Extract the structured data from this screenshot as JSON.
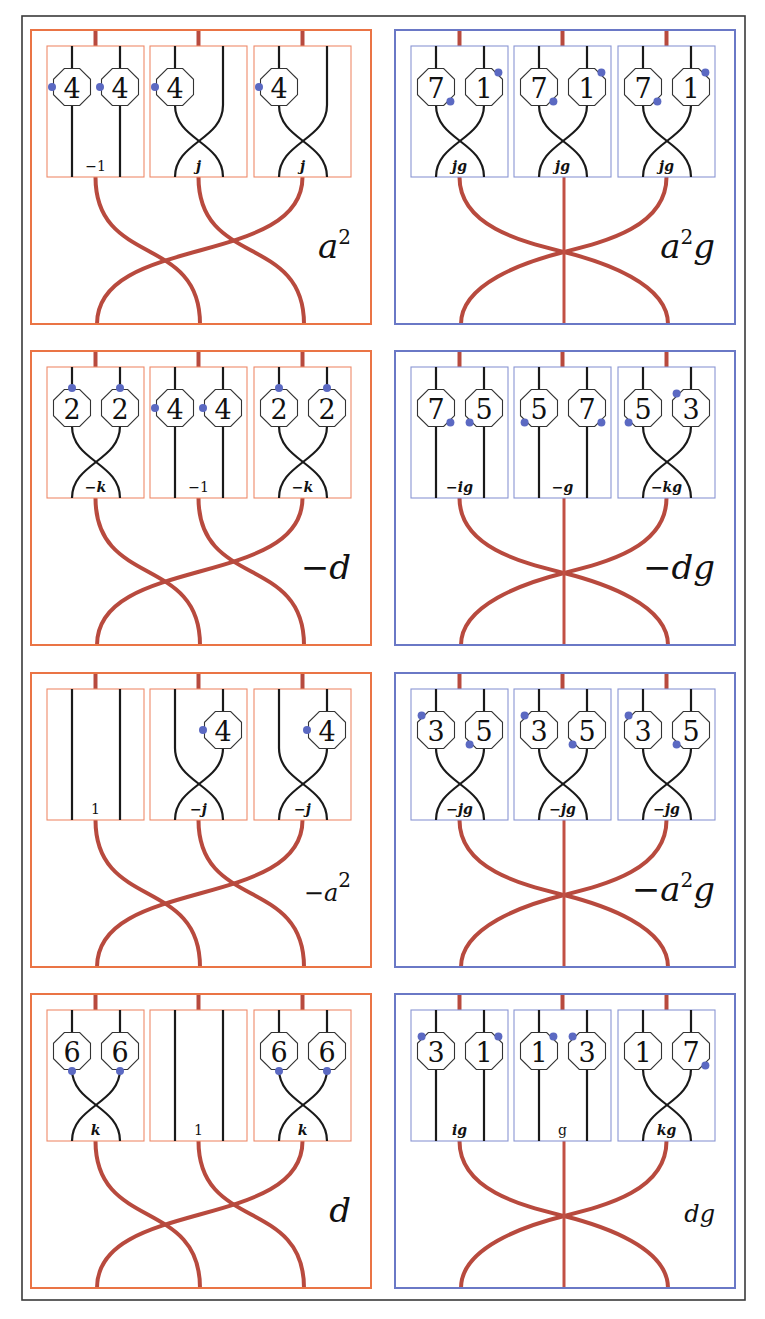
{
  "figure": {
    "colors": {
      "frame": "#3a3a3a",
      "orange_panel": "#ea7445",
      "blue_panel": "#6a78c6",
      "red_strand": "#b84a3e",
      "dot": "#5b69c2"
    },
    "rows": [
      {
        "left": {
          "color": "orange",
          "label": "a²",
          "label_parts": [
            "a",
            "2",
            ""
          ],
          "lower": "braid",
          "boxes": [
            {
              "type": "straight",
              "label": "−1",
              "label_style": "plain",
              "octagons": [
                {
                  "pos": "left",
                  "num": "4",
                  "dot": "w"
                },
                {
                  "pos": "right",
                  "num": "4",
                  "dot": "w"
                }
              ]
            },
            {
              "type": "cross",
              "label": "j",
              "label_style": "bold",
              "octagons": [
                {
                  "pos": "left",
                  "num": "4",
                  "dot": "w"
                }
              ]
            },
            {
              "type": "cross",
              "label": "j",
              "label_style": "bold",
              "octagons": [
                {
                  "pos": "left",
                  "num": "4",
                  "dot": "w"
                }
              ]
            }
          ]
        },
        "right": {
          "color": "blue",
          "label": "a²g",
          "label_parts": [
            "a",
            "2",
            "g"
          ],
          "lower": "star",
          "boxes": [
            {
              "type": "cross",
              "label": "jg",
              "label_style": "bold",
              "octagons": [
                {
                  "pos": "left",
                  "num": "7",
                  "dot": "se"
                },
                {
                  "pos": "right",
                  "num": "1",
                  "dot": "ne"
                }
              ]
            },
            {
              "type": "cross",
              "label": "jg",
              "label_style": "bold",
              "octagons": [
                {
                  "pos": "left",
                  "num": "7",
                  "dot": "se"
                },
                {
                  "pos": "right",
                  "num": "1",
                  "dot": "ne"
                }
              ]
            },
            {
              "type": "cross",
              "label": "jg",
              "label_style": "bold",
              "octagons": [
                {
                  "pos": "left",
                  "num": "7",
                  "dot": "se"
                },
                {
                  "pos": "right",
                  "num": "1",
                  "dot": "ne"
                }
              ]
            }
          ]
        }
      },
      {
        "left": {
          "color": "orange",
          "label": "−d",
          "label_parts": [
            "−d",
            "",
            ""
          ],
          "lower": "braid",
          "boxes": [
            {
              "type": "cross",
              "label": "−k",
              "label_style": "bold",
              "octagons": [
                {
                  "pos": "left",
                  "num": "2",
                  "dot": "n"
                },
                {
                  "pos": "right",
                  "num": "2",
                  "dot": "n"
                }
              ]
            },
            {
              "type": "straight",
              "label": "−1",
              "label_style": "plain",
              "octagons": [
                {
                  "pos": "left",
                  "num": "4",
                  "dot": "w"
                },
                {
                  "pos": "right",
                  "num": "4",
                  "dot": "w"
                }
              ]
            },
            {
              "type": "cross",
              "label": "−k",
              "label_style": "bold",
              "octagons": [
                {
                  "pos": "left",
                  "num": "2",
                  "dot": "n"
                },
                {
                  "pos": "right",
                  "num": "2",
                  "dot": "n"
                }
              ]
            }
          ]
        },
        "right": {
          "color": "blue",
          "label": "−dg",
          "label_parts": [
            "−dg",
            "",
            ""
          ],
          "lower": "star",
          "boxes": [
            {
              "type": "straight",
              "label": "−ig",
              "label_style": "bold",
              "octagons": [
                {
                  "pos": "left",
                  "num": "7",
                  "dot": "se"
                },
                {
                  "pos": "right",
                  "num": "5",
                  "dot": "sw"
                }
              ]
            },
            {
              "type": "straight",
              "label": "−g",
              "label_style": "bold",
              "octagons": [
                {
                  "pos": "left",
                  "num": "5",
                  "dot": "sw"
                },
                {
                  "pos": "right",
                  "num": "7",
                  "dot": "se"
                }
              ]
            },
            {
              "type": "cross",
              "label": "−kg",
              "label_style": "bold",
              "octagons": [
                {
                  "pos": "left",
                  "num": "5",
                  "dot": "sw"
                },
                {
                  "pos": "right",
                  "num": "3",
                  "dot": "nw"
                }
              ]
            }
          ]
        }
      },
      {
        "left": {
          "color": "orange",
          "label": "−a²",
          "label_parts": [
            "−a",
            "2",
            ""
          ],
          "label_size": "small",
          "lower": "braid",
          "boxes": [
            {
              "type": "straight",
              "label": "1",
              "label_style": "plain",
              "octagons": []
            },
            {
              "type": "cross",
              "label": "−j",
              "label_style": "bold",
              "octagons": [
                {
                  "pos": "right",
                  "num": "4",
                  "dot": "w"
                }
              ]
            },
            {
              "type": "cross",
              "label": "−j",
              "label_style": "bold",
              "octagons": [
                {
                  "pos": "right",
                  "num": "4",
                  "dot": "w"
                }
              ]
            }
          ]
        },
        "right": {
          "color": "blue",
          "label": "−a²g",
          "label_parts": [
            "−a",
            "2",
            "g"
          ],
          "lower": "star",
          "boxes": [
            {
              "type": "cross",
              "label": "−jg",
              "label_style": "bold",
              "octagons": [
                {
                  "pos": "left",
                  "num": "3",
                  "dot": "nw"
                },
                {
                  "pos": "right",
                  "num": "5",
                  "dot": "sw"
                }
              ]
            },
            {
              "type": "cross",
              "label": "−jg",
              "label_style": "bold",
              "octagons": [
                {
                  "pos": "left",
                  "num": "3",
                  "dot": "nw"
                },
                {
                  "pos": "right",
                  "num": "5",
                  "dot": "sw"
                }
              ]
            },
            {
              "type": "cross",
              "label": "−jg",
              "label_style": "bold",
              "octagons": [
                {
                  "pos": "left",
                  "num": "3",
                  "dot": "nw"
                },
                {
                  "pos": "right",
                  "num": "5",
                  "dot": "sw"
                }
              ]
            }
          ]
        }
      },
      {
        "left": {
          "color": "orange",
          "label": "d",
          "label_parts": [
            "d",
            "",
            ""
          ],
          "lower": "braid",
          "boxes": [
            {
              "type": "cross",
              "label": "k",
              "label_style": "bold",
              "octagons": [
                {
                  "pos": "left",
                  "num": "6",
                  "dot": "s"
                },
                {
                  "pos": "right",
                  "num": "6",
                  "dot": "s"
                }
              ]
            },
            {
              "type": "straight",
              "label": "1",
              "label_style": "plain",
              "octagons": []
            },
            {
              "type": "cross",
              "label": "k",
              "label_style": "bold",
              "octagons": [
                {
                  "pos": "left",
                  "num": "6",
                  "dot": "s"
                },
                {
                  "pos": "right",
                  "num": "6",
                  "dot": "s"
                }
              ]
            }
          ]
        },
        "right": {
          "color": "blue",
          "label": "dg",
          "label_parts": [
            "dg",
            "",
            ""
          ],
          "label_size": "small",
          "lower": "star",
          "boxes": [
            {
              "type": "straight",
              "label": "ig",
              "label_style": "bold",
              "octagons": [
                {
                  "pos": "left",
                  "num": "3",
                  "dot": "nw"
                },
                {
                  "pos": "right",
                  "num": "1",
                  "dot": "ne"
                }
              ]
            },
            {
              "type": "straight",
              "label": "g",
              "label_style": "plain",
              "octagons": [
                {
                  "pos": "left",
                  "num": "1",
                  "dot": "ne"
                },
                {
                  "pos": "right",
                  "num": "3",
                  "dot": "nw"
                }
              ]
            },
            {
              "type": "cross",
              "label": "kg",
              "label_style": "bold",
              "octagons": [
                {
                  "pos": "left",
                  "num": "1",
                  "dot": "none"
                },
                {
                  "pos": "right",
                  "num": "7",
                  "dot": "se"
                }
              ]
            }
          ]
        }
      }
    ]
  }
}
